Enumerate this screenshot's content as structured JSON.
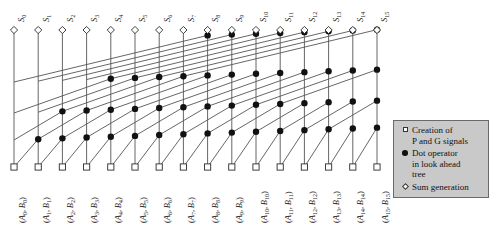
{
  "diagram": {
    "type": "kogge-stone-parallel-prefix-adder",
    "title": "",
    "bit_width": 16,
    "geometry": {
      "col_x_start": 14.0,
      "col_spacing": 24.2,
      "diamond_y": 30.0,
      "square_y": 167.0,
      "row_y": [
        42.0,
        82.0,
        113.0,
        140.0
      ],
      "row_slope": -0.034,
      "node_size_square": 6.2,
      "node_size_dot": 6.4,
      "node_size_diamond": 7.2
    },
    "colors": {
      "line": "#555555",
      "node_stroke": "#2a2a2a",
      "node_fill_open": "#ffffff",
      "node_fill_solid": "#111111",
      "legend_fill": "#c9c9c9",
      "legend_border": "#6a6a6a",
      "text": "#111111"
    },
    "top_labels": [
      "S0",
      "S1",
      "S2",
      "S3",
      "S4",
      "S5",
      "S6",
      "S7",
      "S8",
      "S9",
      "S10",
      "S11",
      "S12",
      "S13",
      "S14",
      "S15"
    ],
    "top_label_base": "S",
    "top_label_subscripts": [
      "0",
      "1",
      "2",
      "3",
      "4",
      "5",
      "6",
      "7",
      "8",
      "9",
      "10",
      "11",
      "12",
      "13",
      "14",
      "15"
    ],
    "bottom_labels": [
      "(A0, B0)",
      "(A1, B1)",
      "(A2, B2)",
      "(A3, B3)",
      "(A4, B4)",
      "(A5, B5)",
      "(A6, B6)",
      "(A7, B7)",
      "(A8, B8)",
      "(A9, B9)",
      "(A10, B10)",
      "(A11, B11)",
      "(A12, B12)",
      "(A13, B13)",
      "(A14, B14)",
      "(A15, B15)"
    ],
    "bottom_label_a": "A",
    "bottom_label_b": "B",
    "bottom_label_subscripts": [
      "0",
      "1",
      "2",
      "3",
      "4",
      "5",
      "6",
      "7",
      "8",
      "9",
      "10",
      "11",
      "12",
      "13",
      "14",
      "15"
    ],
    "stages": [
      {
        "index": 4,
        "row": 0,
        "span": 8,
        "first_col": 8,
        "last_col": 15,
        "dot_count": 8
      },
      {
        "index": 3,
        "row": 1,
        "span": 4,
        "first_col": 4,
        "last_col": 15,
        "dot_count": 12
      },
      {
        "index": 2,
        "row": 2,
        "span": 2,
        "first_col": 2,
        "last_col": 15,
        "dot_count": 14
      },
      {
        "index": 1,
        "row": 3,
        "span": 1,
        "first_col": 1,
        "last_col": 15,
        "dot_count": 15
      }
    ],
    "square_nodes_cols": [
      0,
      1,
      2,
      3,
      4,
      5,
      6,
      7,
      8,
      9,
      10,
      11,
      12,
      13,
      14,
      15
    ],
    "diamond_nodes_cols": [
      0,
      1,
      2,
      3,
      4,
      5,
      6,
      7,
      8,
      9,
      10,
      11,
      12,
      13,
      14,
      15
    ]
  },
  "legend": {
    "items": [
      {
        "symbol": "open-square",
        "lines": [
          "Creation of",
          "P and G signals"
        ]
      },
      {
        "symbol": "filled-dot",
        "lines": [
          "Dot operator",
          "in look ahead",
          "tree"
        ]
      },
      {
        "symbol": "open-diamond",
        "lines": [
          "Sum generation"
        ]
      }
    ]
  }
}
